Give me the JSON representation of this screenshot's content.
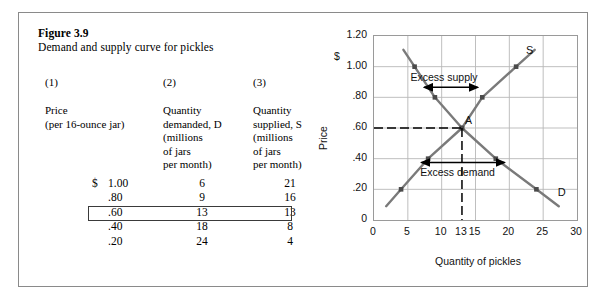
{
  "figure": {
    "number": "Figure 3.9",
    "title": "Demand and supply curve for pickles"
  },
  "table": {
    "column_numbers": [
      "(1)",
      "(2)",
      "(3)"
    ],
    "column_headers": [
      "Price\n(per 16-ounce jar)",
      "Quantity\ndemanded, D\n(millions\nof jars\nper month)",
      "Quantity\nsupplied, S\n(millions\nof jars\nper month)"
    ],
    "currency_symbol": "$",
    "rows": [
      {
        "price": "1.00",
        "demanded": "6",
        "supplied": "21",
        "highlighted": false
      },
      {
        "price": ".80",
        "demanded": "9",
        "supplied": "16",
        "highlighted": false
      },
      {
        "price": ".60",
        "demanded": "13",
        "supplied": "13",
        "highlighted": true
      },
      {
        "price": ".40",
        "demanded": "18",
        "supplied": "8",
        "highlighted": false
      },
      {
        "price": ".20",
        "demanded": "24",
        "supplied": "4",
        "highlighted": false
      }
    ]
  },
  "chart_data": {
    "type": "line",
    "title": "",
    "xlabel": "Quantity of pickles",
    "ylabel": "Price",
    "currency_symbol": "$",
    "xlim": [
      0,
      30
    ],
    "ylim": [
      0,
      1.2
    ],
    "grid": true,
    "xticks": [
      "0",
      "5",
      "10",
      "13",
      "15",
      "20",
      "25",
      "30"
    ],
    "xtick_values": [
      0,
      5,
      10,
      13,
      15,
      20,
      25,
      30
    ],
    "yticks": [
      "1.20",
      "1.00",
      ".80",
      ".60",
      ".40",
      ".20",
      "0"
    ],
    "ytick_values": [
      1.2,
      1.0,
      0.8,
      0.6,
      0.4,
      0.2,
      0
    ],
    "series": [
      {
        "name": "D",
        "label": "D",
        "color": "#7a7a7a",
        "x": [
          6,
          9,
          13,
          18,
          24
        ],
        "y": [
          1.0,
          0.8,
          0.6,
          0.4,
          0.2
        ]
      },
      {
        "name": "S",
        "label": "S",
        "color": "#7a7a7a",
        "x": [
          4,
          8,
          13,
          16,
          21
        ],
        "y": [
          0.2,
          0.4,
          0.6,
          0.8,
          1.0
        ]
      }
    ],
    "equilibrium": {
      "label": "A",
      "x": 13,
      "y": 0.6
    },
    "annotations": [
      {
        "text": "Excess supply",
        "x": 10.5,
        "y": 0.92
      },
      {
        "text": "Excess demand",
        "x": 12.5,
        "y": 0.3
      }
    ]
  }
}
